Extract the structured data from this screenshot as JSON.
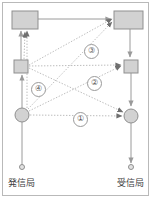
{
  "diagram": {
    "stations": {
      "left": {
        "label": "発信局"
      },
      "right": {
        "label": "受信局"
      }
    },
    "nodes": [
      {
        "name": "left-layer3-box",
        "shape": "rect",
        "x": 12,
        "y": 11,
        "w": 26,
        "h": 18
      },
      {
        "name": "right-layer3-box",
        "shape": "rect",
        "x": 114,
        "y": 11,
        "w": 29,
        "h": 18
      },
      {
        "name": "left-layer2-box",
        "shape": "rect",
        "x": 14,
        "y": 60,
        "w": 14,
        "h": 13
      },
      {
        "name": "right-layer2-box",
        "shape": "rect",
        "x": 124,
        "y": 60,
        "w": 14,
        "h": 13
      },
      {
        "name": "left-layer1-node",
        "shape": "circle",
        "cx": 22,
        "cy": 115,
        "r": 7
      },
      {
        "name": "right-layer1-node",
        "shape": "circle",
        "cx": 131,
        "cy": 116,
        "r": 7
      },
      {
        "name": "left-terminal-dot",
        "shape": "circle",
        "cx": 22,
        "cy": 167,
        "r": 2.5
      },
      {
        "name": "right-terminal-dot",
        "shape": "circle",
        "cx": 131,
        "cy": 167,
        "r": 2.5
      }
    ],
    "protocol_labels": [
      {
        "id": "1",
        "text": "①",
        "x": 73,
        "y": 112
      },
      {
        "id": "2",
        "text": "②",
        "x": 87,
        "y": 76
      },
      {
        "id": "3",
        "text": "③",
        "x": 84,
        "y": 44
      },
      {
        "id": "4",
        "text": "④",
        "x": 31,
        "y": 82
      }
    ],
    "colors": {
      "fill": "#d2d2d2",
      "stroke": "#8f8f8f",
      "solid_line": "#9a9a9a",
      "dotted_line": "#bdbdbd",
      "text": "#3d3d3d",
      "frame": "#b9b9b9",
      "background": "#ffffff"
    }
  }
}
